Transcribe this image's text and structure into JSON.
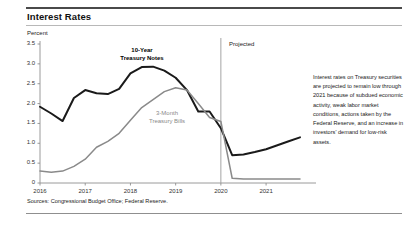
{
  "header": {
    "title": "Interest Rates"
  },
  "source_note": "Sources: Congressional Budget Office; Federal Reserve.",
  "annotation": {
    "text": "Interest rates on Treasury securities are projected to remain low through 2021 because of subdued economic activity, weak labor market conditions, actions taken by the Federal Reserve, and an increase in investors' demand for low-risk assets."
  },
  "colors": {
    "notes_line": "#1a1a1a",
    "bills_line": "#8a8a8a",
    "axis": "#8f8f8f",
    "rule": "#4a4a4a",
    "projection_divider": "#9a9a9a"
  },
  "chart_data": {
    "type": "line",
    "title": "Interest Rates",
    "xlabel": "",
    "ylabel": "Percent",
    "ylim": [
      0,
      3.5
    ],
    "yticks": [
      "0",
      "0.5",
      "1.0",
      "1.5",
      "2.0",
      "2.5",
      "3.0",
      "3.5"
    ],
    "ytick_values": [
      0,
      0.5,
      1.0,
      1.5,
      2.0,
      2.5,
      3.0,
      3.5
    ],
    "xticks": [
      "2016",
      "2017",
      "2018",
      "2019",
      "2020",
      "2021"
    ],
    "xtick_values": [
      2016,
      2017,
      2018,
      2019,
      2020,
      2021
    ],
    "xlim": [
      2016,
      2021.75
    ],
    "grid": false,
    "legend_position": "inline-labels",
    "annotations": [
      {
        "label": "Projected",
        "x": 2020.0
      }
    ],
    "projection_start": 2020.0,
    "series": [
      {
        "name": "10-Year Treasury Notes",
        "color": "#1a1a1a",
        "x": [
          2016.0,
          2016.25,
          2016.5,
          2016.75,
          2017.0,
          2017.25,
          2017.5,
          2017.75,
          2018.0,
          2018.25,
          2018.5,
          2018.75,
          2019.0,
          2019.25,
          2019.5,
          2019.75,
          2020.0,
          2020.25,
          2020.5,
          2020.75,
          2021.0,
          2021.25,
          2021.5,
          2021.75
        ],
        "values": [
          1.92,
          1.75,
          1.56,
          2.14,
          2.34,
          2.26,
          2.24,
          2.37,
          2.76,
          2.92,
          2.93,
          2.83,
          2.65,
          2.34,
          1.8,
          1.8,
          1.38,
          0.7,
          0.72,
          0.78,
          0.85,
          0.95,
          1.05,
          1.15
        ]
      },
      {
        "name": "3-Month Treasury Bills",
        "color": "#8a8a8a",
        "x": [
          2016.0,
          2016.25,
          2016.5,
          2016.75,
          2017.0,
          2017.25,
          2017.5,
          2017.75,
          2018.0,
          2018.25,
          2018.5,
          2018.75,
          2019.0,
          2019.25,
          2019.5,
          2019.75,
          2020.0,
          2020.25,
          2020.5,
          2020.75,
          2021.0,
          2021.25,
          2021.5,
          2021.75
        ],
        "values": [
          0.3,
          0.27,
          0.3,
          0.42,
          0.6,
          0.9,
          1.05,
          1.25,
          1.58,
          1.9,
          2.1,
          2.3,
          2.4,
          2.34,
          2.0,
          1.65,
          1.55,
          0.12,
          0.1,
          0.1,
          0.1,
          0.1,
          0.1,
          0.1
        ]
      }
    ],
    "series_labels": [
      {
        "name": "10-Year Treasury Notes",
        "line1": "10-Year",
        "line2": "Treasury Notes",
        "bold": true
      },
      {
        "name": "3-Month Treasury Bills",
        "line1": "3-Month",
        "line2": "Treasury Bills",
        "bold": false
      }
    ]
  }
}
